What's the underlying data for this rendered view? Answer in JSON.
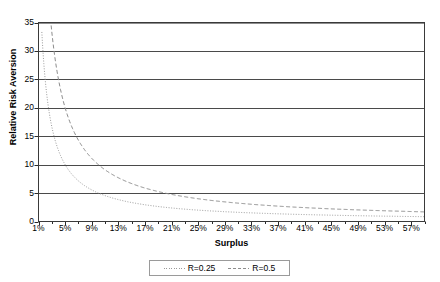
{
  "chart_data": {
    "type": "line",
    "title": "",
    "xlabel": "Surplus",
    "ylabel": "Relative Risk Aversion",
    "xlim": [
      0.01,
      0.59
    ],
    "ylim": [
      0,
      35
    ],
    "grid": true,
    "grid_axis": "y",
    "legend_position": "bottom",
    "xtick_labels": [
      "1%",
      "5%",
      "9%",
      "13%",
      "17%",
      "21%",
      "25%",
      "29%",
      "33%",
      "37%",
      "41%",
      "45%",
      "49%",
      "53%",
      "57%"
    ],
    "xtick_values": [
      1,
      5,
      9,
      13,
      17,
      21,
      25,
      29,
      33,
      37,
      41,
      45,
      49,
      53,
      57
    ],
    "ytick_labels": [
      "0",
      "5",
      "10",
      "15",
      "20",
      "25",
      "30",
      "35"
    ],
    "ytick_values": [
      0,
      5,
      10,
      15,
      20,
      25,
      30,
      35
    ],
    "x": [
      1,
      2,
      3,
      4,
      5,
      6,
      7,
      8,
      9,
      10,
      11,
      12,
      13,
      14,
      15,
      16,
      17,
      18,
      19,
      20,
      21,
      22,
      23,
      24,
      25,
      26,
      27,
      28,
      29,
      30,
      31,
      32,
      33,
      34,
      35,
      36,
      37,
      38,
      39,
      40,
      41,
      42,
      43,
      44,
      45,
      46,
      47,
      48,
      49,
      50,
      51,
      52,
      53,
      54,
      55,
      56,
      57,
      58,
      59
    ],
    "series": [
      {
        "name": "R=0.25",
        "color": "#9a9a9a",
        "dash": "dotted",
        "values": [
          50,
          25,
          16.67,
          12.5,
          10,
          8.33,
          7.14,
          6.25,
          5.56,
          5,
          4.55,
          4.17,
          3.85,
          3.57,
          3.33,
          3.13,
          2.94,
          2.78,
          2.63,
          2.5,
          2.38,
          2.27,
          2.17,
          2.08,
          2,
          1.92,
          1.85,
          1.79,
          1.72,
          1.67,
          1.61,
          1.56,
          1.52,
          1.47,
          1.43,
          1.39,
          1.35,
          1.32,
          1.28,
          1.25,
          1.22,
          1.19,
          1.16,
          1.14,
          1.11,
          1.09,
          1.06,
          1.04,
          1.02,
          1,
          0.98,
          0.96,
          0.94,
          0.93,
          0.91,
          0.89,
          0.88,
          0.86,
          0.85
        ]
      },
      {
        "name": "R=0.5",
        "color": "#8c8c8c",
        "dash": "dashed",
        "values": [
          100,
          50,
          33.33,
          25,
          20,
          16.67,
          14.29,
          12.5,
          11.11,
          10,
          9.09,
          8.33,
          7.69,
          7.14,
          6.67,
          6.25,
          5.88,
          5.56,
          5.26,
          5,
          4.76,
          4.55,
          4.35,
          4.17,
          4,
          3.85,
          3.7,
          3.57,
          3.45,
          3.33,
          3.23,
          3.13,
          3.03,
          2.94,
          2.86,
          2.78,
          2.7,
          2.63,
          2.56,
          2.5,
          2.44,
          2.38,
          2.33,
          2.27,
          2.22,
          2.17,
          2.13,
          2.08,
          2.04,
          2,
          1.96,
          1.92,
          1.89,
          1.85,
          1.82,
          1.79,
          1.75,
          1.72,
          1.69
        ]
      }
    ],
    "formula": "RRA = 2R / Surplus"
  },
  "legend": {
    "items": [
      {
        "label": "R=0.25"
      },
      {
        "label": "R=0.5"
      }
    ]
  },
  "axes": {
    "x_title": "Surplus",
    "y_title": "Relative Risk Aversion"
  }
}
